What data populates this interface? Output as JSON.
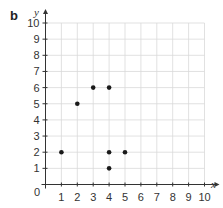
{
  "panel_label": "b",
  "colors": {
    "grid": "#d9d9d9",
    "axis": "#333333",
    "point": "#1a1a1a",
    "text": "#333333"
  },
  "chart_data": {
    "type": "scatter",
    "title": "",
    "xlabel": "x",
    "ylabel": "y",
    "xlim": [
      0,
      10
    ],
    "ylim": [
      0,
      10
    ],
    "grid": true,
    "origin_label": "0",
    "x_ticks": [
      1,
      2,
      3,
      4,
      5,
      6,
      7,
      8,
      9,
      10
    ],
    "y_ticks": [
      1,
      2,
      3,
      4,
      5,
      6,
      7,
      8,
      9,
      10
    ],
    "points": [
      {
        "x": 1,
        "y": 2
      },
      {
        "x": 2,
        "y": 5
      },
      {
        "x": 3,
        "y": 6
      },
      {
        "x": 4,
        "y": 6
      },
      {
        "x": 4,
        "y": 2
      },
      {
        "x": 4,
        "y": 1
      },
      {
        "x": 5,
        "y": 2
      }
    ]
  }
}
